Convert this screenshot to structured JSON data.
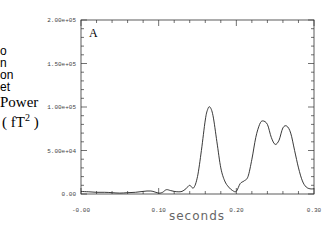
{
  "side_text": {
    "fragments": [
      "o",
      "n",
      "on",
      "et"
    ],
    "ylabel_line1": "Power",
    "ylabel_line2": "( fT",
    "ylabel_sup": "2",
    "ylabel_close": " )"
  },
  "chart_data": {
    "type": "line",
    "title": "",
    "panel_label": "A",
    "xlabel": "seconds",
    "ylabel": "Power (fT^2)",
    "xlim": [
      0.0,
      0.3
    ],
    "ylim": [
      0,
      200000
    ],
    "x_ticks": [
      "-0.00",
      "0.10",
      "0.20",
      "0.30"
    ],
    "y_ticks": [
      "0.00",
      "5.00e+04",
      "1.00e+05",
      "1.50e+05",
      "2.00e+05"
    ],
    "grid": false,
    "legend": null,
    "series": [
      {
        "name": "Power",
        "x": [
          0.0,
          0.01,
          0.02,
          0.03,
          0.04,
          0.05,
          0.06,
          0.07,
          0.08,
          0.09,
          0.1,
          0.105,
          0.11,
          0.115,
          0.12,
          0.125,
          0.13,
          0.135,
          0.14,
          0.145,
          0.15,
          0.155,
          0.16,
          0.163,
          0.166,
          0.17,
          0.175,
          0.18,
          0.185,
          0.19,
          0.195,
          0.2,
          0.205,
          0.21,
          0.215,
          0.22,
          0.225,
          0.23,
          0.234,
          0.24,
          0.245,
          0.25,
          0.255,
          0.26,
          0.265,
          0.27,
          0.275,
          0.28,
          0.285,
          0.29,
          0.295,
          0.3
        ],
        "values": [
          3000,
          2500,
          2000,
          2000,
          1500,
          1000,
          1500,
          2000,
          3000,
          3500,
          1000,
          2000,
          5000,
          4000,
          3000,
          2500,
          3000,
          6000,
          10000,
          7000,
          20000,
          50000,
          85000,
          97000,
          100000,
          90000,
          60000,
          30000,
          15000,
          8000,
          4000,
          3000,
          12000,
          15000,
          20000,
          40000,
          65000,
          80000,
          84000,
          80000,
          65000,
          57000,
          62000,
          76000,
          78000,
          70000,
          50000,
          30000,
          15000,
          8000,
          6000,
          6000
        ]
      }
    ]
  }
}
